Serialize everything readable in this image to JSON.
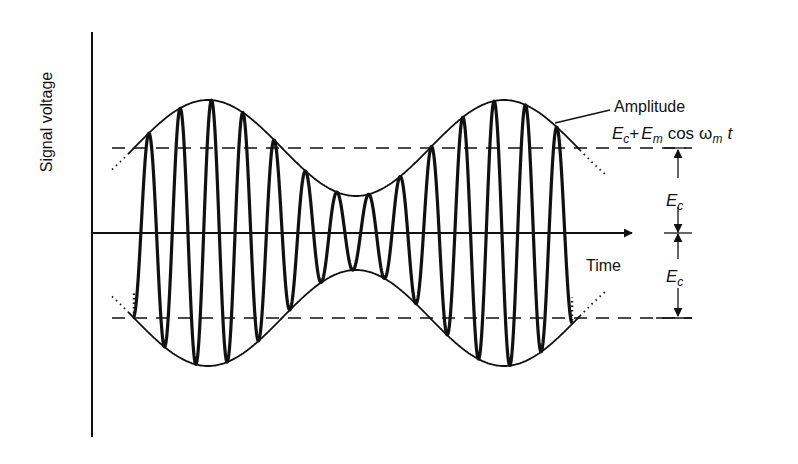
{
  "diagram": {
    "type": "amplitude-modulated-wave",
    "labels": {
      "y_axis": "Signal voltage",
      "x_axis": "Time",
      "amplitude_title": "Amplitude",
      "amplitude_formula": {
        "Ec_base": "E",
        "Ec_sub": "c",
        "plus": "+",
        "Em_base": "E",
        "Em_sub": "m",
        "cos": "cos",
        "omega": "ω",
        "omega_sub": "m",
        "t": "t"
      },
      "dimension_upper": {
        "base": "E",
        "sub": "c"
      },
      "dimension_lower": {
        "base": "E",
        "sub": "c"
      }
    },
    "colors": {
      "ink": "#111111",
      "background": "#ffffff"
    },
    "geometry": {
      "y_axis": {
        "x": 92,
        "y1": 32,
        "y2": 437
      },
      "time_axis": {
        "y": 233,
        "x1": 92,
        "x2": 632
      },
      "carrier_level_upper_y": 148,
      "carrier_level_lower_y": 318,
      "dashed_x1": 112,
      "dashed_x2": 692,
      "envelope": {
        "center_y": 233,
        "carrier_amplitude": 85,
        "modulation_amplitude": 48,
        "period_px": 296,
        "phase_peak_x": 208,
        "x_start": 112,
        "x_end": 605
      },
      "carrier": {
        "period_px": 31.4,
        "first_trough_x": 133,
        "x_start": 133,
        "x_end": 572
      },
      "dimension_arrow_x": 678
    }
  }
}
